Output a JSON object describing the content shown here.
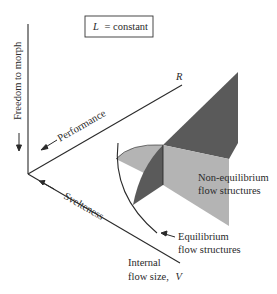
{
  "diagram": {
    "constraint_box": {
      "variable": "L",
      "text": "= constant"
    },
    "axes": {
      "vertical": {
        "label": "Freedom to morph"
      },
      "performance": {
        "label": "Performance",
        "end_label": "R"
      },
      "svelteness": {
        "label": "Svelteness"
      },
      "size": {
        "label_line1": "Internal",
        "label_line2": "flow size,",
        "variable": "V"
      }
    },
    "regions": {
      "non_equilibrium": {
        "line1": "Non-equilibrium",
        "line2": "flow structures"
      },
      "equilibrium": {
        "line1": "Equilibrium",
        "line2": "flow structures"
      }
    },
    "colors": {
      "dark_gray": "#5a5a5a",
      "light_gray": "#b4b4b4",
      "line": "#2a2a2a",
      "background": "#ffffff"
    }
  }
}
